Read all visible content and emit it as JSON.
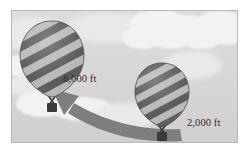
{
  "illustration": {
    "title": "hot-air-balloon-altitude-comparison",
    "background": {
      "sky_color": "#d8d8d8",
      "cloud_color": "#f2f2f2",
      "frame_border_color": "#b9b9b9",
      "page_color": "#ffffff"
    },
    "balloons": [
      {
        "id": "left-balloon",
        "name": "high-balloon",
        "altitude_label": "6,000 ft",
        "envelope_dark_color": "#5a5a5a",
        "envelope_light_color": "#b8b8b8",
        "basket_color": "#3a3a3a",
        "position": "upper-left"
      },
      {
        "id": "right-balloon",
        "name": "low-balloon",
        "altitude_label": "2,000 ft",
        "envelope_dark_color": "#5a5a5a",
        "envelope_light_color": "#b8b8b8",
        "basket_color": "#3a3a3a",
        "position": "lower-right"
      }
    ],
    "arrow": {
      "name": "ascent-arrow",
      "color": "#7e7e7e",
      "direction": "from-lower-right-to-upper-left",
      "description": "curved arrow from 2,000 ft balloon up to 6,000 ft balloon"
    },
    "labels": {
      "high_altitude": "6,000 ft",
      "low_altitude": "2,000 ft"
    }
  }
}
